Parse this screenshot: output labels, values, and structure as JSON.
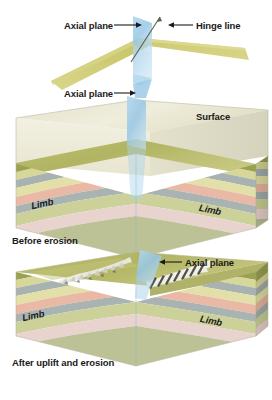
{
  "figure": {
    "type": "geology-block-diagram",
    "background_color": "#ffffff"
  },
  "labels": {
    "axial_plane_top": "Axial plane",
    "hinge_line": "Hinge line",
    "axial_plane_middle": "Axial plane",
    "surface": "Surface",
    "limb_middle_left": "Limb",
    "limb_middle_right": "Limb",
    "caption_before": "Before erosion",
    "axial_plane_bottom": "Axial plane",
    "limb_bottom_left": "Limb",
    "limb_bottom_right": "Limb",
    "caption_after": "After uplift and erosion"
  },
  "panels": [
    {
      "id": "fold-surface",
      "name": "folded surface with axial plane and hinge line",
      "elements": [
        "folded-bedding-surface",
        "axial-plane-sheet",
        "hinge-line"
      ]
    },
    {
      "id": "block-before-erosion",
      "name": "block diagram before erosion",
      "caption": "Before erosion",
      "elements": [
        "transparent-surface-slab",
        "axial-plane-sheet",
        "arched-strata",
        "limb-left",
        "limb-right"
      ]
    },
    {
      "id": "block-after-erosion",
      "name": "block diagram after uplift and erosion",
      "caption": "After uplift and erosion",
      "elements": [
        "eroded-top-surface",
        "rocky-ridge-outcrops",
        "axial-plane-sheet",
        "arched-strata",
        "limb-left",
        "limb-right"
      ]
    }
  ],
  "colors": {
    "axial_plane": "#9ecbe8",
    "axial_plane_dark": "#7fb8dd",
    "fold_surface_front": "#cfcb72",
    "fold_surface_back": "#c3c06a",
    "surface_slab": "#ece8d2",
    "top_olive": "#b9bb6a",
    "top_olive_light": "#cfd08a",
    "outcrop_white": "#f2f2ee",
    "outcrop_shadow": "#2e2e28",
    "label_text": "#1a1a1a",
    "arrow": "#1a1a1a"
  },
  "strata": {
    "description": "Sedimentary layer sequence from top to bottom on the exposed block faces",
    "layers": [
      {
        "name": "olive-sandstone",
        "color": "#9aa153"
      },
      {
        "name": "pale-yellow-siltstone",
        "color": "#d8d79a"
      },
      {
        "name": "gray-blue-shale",
        "color": "#a8b2b0"
      },
      {
        "name": "light-yellow-sandstone",
        "color": "#e2e0a8"
      },
      {
        "name": "pink-limestone",
        "color": "#e9b9a6"
      },
      {
        "name": "gray-blue-shale-2",
        "color": "#a9b3b2"
      },
      {
        "name": "pale-green-sandstone",
        "color": "#ccd19a"
      },
      {
        "name": "pale-pink-limestone",
        "color": "#e8d3cf"
      },
      {
        "name": "basal-gray-green",
        "color": "#b9bf94"
      }
    ]
  }
}
